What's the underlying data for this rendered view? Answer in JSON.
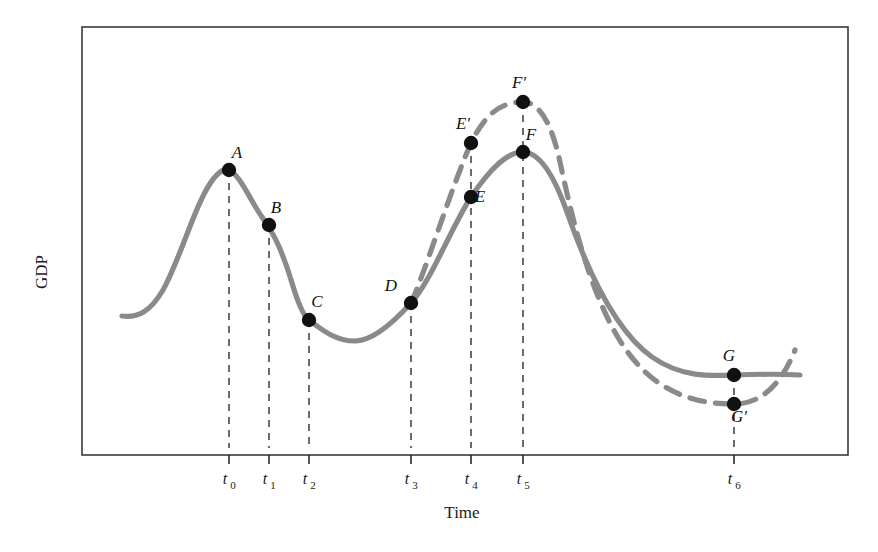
{
  "figure": {
    "name": "business-cycle-gdp-diagram",
    "background": "#ffffff",
    "frame_color": "#3a3a3a",
    "curve_color": "#8a8a8a",
    "point_color": "#111111",
    "guide_color": "#3a3a3a"
  },
  "axes": {
    "ylabel": "GDP",
    "xlabel": "Time",
    "plot_box": {
      "left": 82,
      "top": 27,
      "right": 848,
      "bottom": 455
    }
  },
  "ticks": {
    "labels": [
      "t",
      "t",
      "t",
      "t",
      "t",
      "t",
      "t"
    ],
    "subscripts": [
      "0",
      "1",
      "2",
      "3",
      "4",
      "5",
      "6"
    ],
    "x": [
      229,
      269,
      309,
      411,
      471,
      523,
      734
    ]
  },
  "point_labels": {
    "A": "A",
    "B": "B",
    "C": "C",
    "D": "D",
    "E": "E",
    "Eprime": "E",
    "F": "F",
    "Fprime": "F",
    "G": "G",
    "Gprime": "G",
    "prime_mark": "′"
  },
  "chart_data": {
    "type": "line",
    "title": "",
    "xlabel": "Time",
    "ylabel": "GDP",
    "xlim": [
      82,
      848
    ],
    "ylim": [
      455,
      27
    ],
    "grid": false,
    "legend": "none",
    "note": "Stylized business-cycle schematic. Axis values are unlabeled; coordinates are in pixel space with y inverted (smaller y = higher GDP).",
    "tick_positions": {
      "t0": 229,
      "t1": 269,
      "t2": 309,
      "t3": 411,
      "t4": 471,
      "t5": 523,
      "t6": 734
    },
    "series": [
      {
        "name": "Actual GDP (solid)",
        "style": "solid",
        "color": "#8a8a8a",
        "path": "M 122 316 C 138 318 150 312 163 290 C 181 258 196 200 214 178 C 221 170 225 168 229 170 C 240 175 250 200 262 217 C 270 228 280 243 292 283 C 298 303 303 316 309 320 C 322 330 336 341 355 341 C 372 341 392 324 411 303 C 430 283 452 226 471 197 C 492 166 508 152 523 152 C 541 152 556 180 568 215 C 586 266 614 330 652 357 C 682 378 712 376 734 375 C 760 374 782 374 800 375"
      },
      {
        "name": "Alternative / policy GDP (dashed)",
        "style": "dashed",
        "color": "#8a8a8a",
        "path": "M 411 303 C 424 275 452 186 471 143 C 488 108 506 102 523 102 C 540 102 552 125 560 162 C 570 208 586 281 616 334 C 648 390 690 404 734 404 C 762 404 782 383 795 350"
      }
    ],
    "points": [
      {
        "id": "A",
        "label": "A",
        "x": 229,
        "y": 170,
        "series": "solid",
        "label_dx": 8,
        "label_dy": -12
      },
      {
        "id": "B",
        "label": "B",
        "x": 269,
        "y": 225,
        "series": "solid",
        "label_dx": 7,
        "label_dy": -12
      },
      {
        "id": "C",
        "label": "C",
        "x": 309,
        "y": 320,
        "series": "solid",
        "label_dx": 8,
        "label_dy": -13
      },
      {
        "id": "D",
        "label": "D",
        "x": 411,
        "y": 303,
        "series": "solid",
        "label_dx": -20,
        "label_dy": -12
      },
      {
        "id": "E",
        "label": "E",
        "x": 471,
        "y": 197,
        "series": "solid",
        "label_dx": 9,
        "label_dy": 5
      },
      {
        "id": "Eprime",
        "label": "E′",
        "x": 471,
        "y": 143,
        "series": "dashed",
        "label_dx": -8,
        "label_dy": -14
      },
      {
        "id": "F",
        "label": "F",
        "x": 523,
        "y": 152,
        "series": "solid",
        "label_dx": 8,
        "label_dy": -12
      },
      {
        "id": "Fprime",
        "label": "F′",
        "x": 523,
        "y": 102,
        "series": "dashed",
        "label_dx": -4,
        "label_dy": -14
      },
      {
        "id": "G",
        "label": "G",
        "x": 734,
        "y": 375,
        "series": "solid",
        "label_dx": -5,
        "label_dy": -14
      },
      {
        "id": "Gprime",
        "label": "G′",
        "x": 734,
        "y": 404,
        "series": "dashed",
        "label_dx": 5,
        "label_dy": 18
      }
    ],
    "drop_lines": [
      {
        "x": 229,
        "y_top": 170,
        "y_bottom": 448
      },
      {
        "x": 269,
        "y_top": 225,
        "y_bottom": 448
      },
      {
        "x": 309,
        "y_top": 320,
        "y_bottom": 448
      },
      {
        "x": 411,
        "y_top": 303,
        "y_bottom": 448
      },
      {
        "x": 471,
        "y_top": 143,
        "y_bottom": 448
      },
      {
        "x": 523,
        "y_top": 102,
        "y_bottom": 448
      },
      {
        "x": 734,
        "y_top": 375,
        "y_bottom": 448
      }
    ]
  }
}
